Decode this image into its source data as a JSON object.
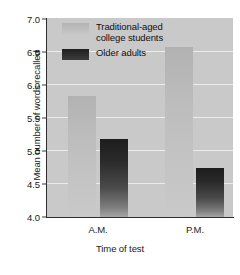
{
  "chart_data": {
    "type": "bar",
    "title": "",
    "xlabel": "Time of test",
    "ylabel": "Mean number of words recalled",
    "categories": [
      "A.M.",
      "P.M."
    ],
    "ylim": [
      4.0,
      7.0
    ],
    "yticks": [
      "4.0",
      "4.5",
      "5.0",
      "5.5",
      "6.0",
      "6.5",
      "7.0"
    ],
    "ytick_values": [
      4.0,
      4.5,
      5.0,
      5.5,
      6.0,
      6.5,
      7.0
    ],
    "grid": true,
    "legend_position": "upper-left-inside",
    "series": [
      {
        "name": "Traditional-aged college students",
        "name_line1": "Traditional-aged",
        "name_line2": "college students",
        "color": "#bdbdbd",
        "values": [
          5.82,
          6.56
        ]
      },
      {
        "name": "Older adults",
        "name_line1": "Older adults",
        "name_line2": "",
        "color": "#2a2a2a",
        "values": [
          5.18,
          4.74
        ]
      }
    ]
  },
  "figure": {
    "plot_background": "#c9c9c9",
    "gridline_color": "#ececec",
    "axis_color": "#2e2e2e",
    "page_background": "#ffffff"
  }
}
